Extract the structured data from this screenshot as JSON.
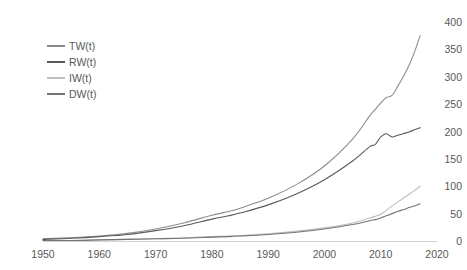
{
  "chart_data": {
    "type": "line",
    "title": "",
    "xlabel": "",
    "ylabel": "",
    "xlim": [
      1950,
      2020
    ],
    "ylim": [
      0,
      400
    ],
    "grid": false,
    "legend_position": "top-left-inside",
    "xticks": [
      "1950",
      "1960",
      "1970",
      "1980",
      "1990",
      "2000",
      "2010",
      "2020"
    ],
    "yticks": [
      "0",
      "50",
      "100",
      "150",
      "200",
      "250",
      "300",
      "350",
      "400"
    ],
    "x": [
      1950,
      1955,
      1960,
      1965,
      1970,
      1975,
      1980,
      1983,
      1985,
      1990,
      1995,
      2000,
      2005,
      2008,
      2009,
      2010,
      2011,
      2012,
      2013,
      2014,
      2015,
      2016,
      2017
    ],
    "series": [
      {
        "name": "TW(t)",
        "color": "#8c8c8c",
        "values": [
          4,
          6,
          9,
          14,
          22,
          33,
          47,
          54,
          60,
          78,
          103,
          137,
          186,
          228,
          240,
          252,
          262,
          266,
          282,
          300,
          320,
          345,
          375
        ]
      },
      {
        "name": "RW(t)",
        "color": "#595959",
        "values": [
          3,
          5,
          8,
          12,
          19,
          28,
          40,
          46,
          51,
          66,
          86,
          112,
          146,
          172,
          176,
          190,
          196,
          190,
          193,
          196,
          199,
          203,
          207
        ]
      },
      {
        "name": "IW(t)",
        "color": "#bfbfbf",
        "values": [
          1,
          1,
          2,
          3,
          4,
          6,
          8,
          9,
          10,
          13,
          18,
          24,
          33,
          42,
          45,
          49,
          56,
          64,
          71,
          78,
          85,
          92,
          100
        ]
      },
      {
        "name": "DW(t)",
        "color": "#737373",
        "values": [
          1,
          1,
          2,
          3,
          4,
          5,
          7,
          8,
          9,
          12,
          16,
          22,
          30,
          37,
          39,
          42,
          46,
          50,
          54,
          57,
          61,
          64,
          68
        ]
      }
    ]
  }
}
